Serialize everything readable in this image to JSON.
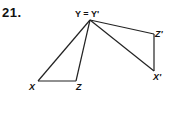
{
  "problem": {
    "number": "21."
  },
  "labels": {
    "apex": "Y = Y'",
    "x": "X",
    "z": "Z",
    "z_prime": "Z'",
    "x_prime": "X'"
  },
  "figure": {
    "stroke_color": "#222222",
    "points": {
      "Y": [
        90,
        20
      ],
      "X": [
        38,
        81
      ],
      "Z": [
        76,
        81
      ],
      "Z_prime": [
        154,
        34
      ],
      "X_prime": [
        154,
        71
      ]
    },
    "triangles": [
      {
        "name": "XYZ",
        "vertices": [
          "X",
          "Y",
          "Z"
        ]
      },
      {
        "name": "X'Y'Z'",
        "vertices": [
          "X_prime",
          "Y",
          "Z_prime"
        ]
      }
    ]
  }
}
